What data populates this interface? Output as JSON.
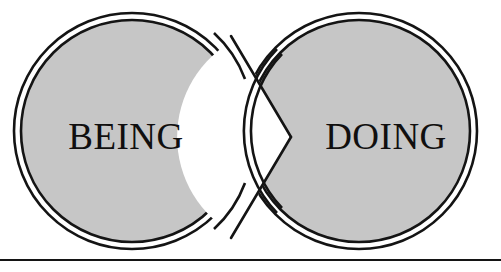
{
  "diagram": {
    "type": "two-circle-chevron",
    "title": "",
    "background_color": "#ffffff",
    "stroke_color": "#141414",
    "fill_color": "#c6c6c6",
    "nodes": [
      {
        "id": "being",
        "label": "BEING",
        "shape": "double-ring-circle",
        "fill": "#c6c6c6",
        "center_x": 132,
        "center_y": 131,
        "radius": 118
      },
      {
        "id": "doing",
        "label": "DOING",
        "shape": "double-ring-circle",
        "fill": "#c6c6c6",
        "center_x": 359,
        "center_y": 131,
        "radius": 118
      }
    ],
    "connector": {
      "id": "chevron",
      "kind": "white-arrow-wedge",
      "direction": "right",
      "from": "being",
      "to": "doing",
      "apex_x": 288,
      "apex_y": 137
    },
    "baseline_rule": {
      "id": "bottom-rule",
      "y": 260,
      "color": "#141414",
      "thickness": 2
    }
  }
}
